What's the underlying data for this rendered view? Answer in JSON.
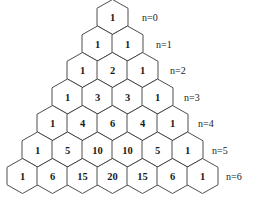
{
  "figure": {
    "background_color": "#ffffff",
    "stroke_color": "#3a3a3a",
    "text_color": "#1a1a1a"
  },
  "chart_data": {
    "type": "table",
    "xlabel": "",
    "ylabel": "",
    "grid": false,
    "legend": "none",
    "layout": {
      "shape": "hexagon",
      "orientation": "pointy-top",
      "hex_width": 31,
      "hex_height": 35,
      "x_pitch": 30,
      "y_pitch": 26.5,
      "apex_center_x": 112.5,
      "first_row_center_y": 17,
      "label_start_x": 142,
      "label_x_step": 14
    },
    "row_label_prefix": "n=",
    "rows": [
      {
        "n": 0,
        "label": "n=0",
        "values": [
          1
        ]
      },
      {
        "n": 1,
        "label": "n=1",
        "values": [
          1,
          1
        ]
      },
      {
        "n": 2,
        "label": "n=2",
        "values": [
          1,
          2,
          1
        ]
      },
      {
        "n": 3,
        "label": "n=3",
        "values": [
          1,
          3,
          3,
          1
        ]
      },
      {
        "n": 4,
        "label": "n=4",
        "values": [
          1,
          4,
          6,
          4,
          1
        ]
      },
      {
        "n": 5,
        "label": "n=5",
        "values": [
          1,
          5,
          10,
          10,
          5,
          1
        ]
      },
      {
        "n": 6,
        "label": "n=6",
        "values": [
          1,
          6,
          15,
          20,
          15,
          6,
          1
        ]
      }
    ]
  }
}
